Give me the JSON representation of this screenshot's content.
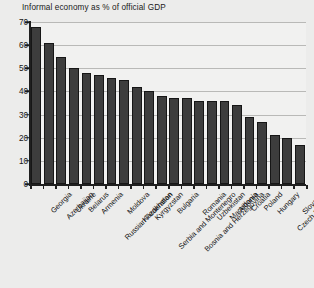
{
  "chart_data": {
    "type": "bar",
    "title": "Informal economy as % of official GDP",
    "xlabel": "",
    "ylabel": "",
    "ylim": [
      0,
      70
    ],
    "yticks": [
      0,
      10,
      20,
      30,
      40,
      50,
      60,
      70
    ],
    "grid": true,
    "legend": "none",
    "bar_color": "#3d3d3d",
    "categories": [
      "Georgia",
      "Azerbaijan",
      "Ukraine",
      "Belarus",
      "Armenia",
      "Russian Federation",
      "Moldova",
      "Kazakhstan",
      "Kyrgyzstan",
      "Serbia and Montenegro",
      "Bulgaria",
      "Bosnia and Herzegovina",
      "Romania",
      "Uzbekistan",
      "Macedonia",
      "Albania",
      "Croatia",
      "Poland",
      "Hungary",
      "Czech Republic",
      "Slovakia",
      "OECD"
    ],
    "values": [
      68,
      61,
      55,
      50,
      48,
      47,
      46,
      45,
      42,
      40,
      38,
      37,
      37,
      36,
      36,
      36,
      34,
      29,
      27,
      21,
      20,
      17
    ]
  }
}
